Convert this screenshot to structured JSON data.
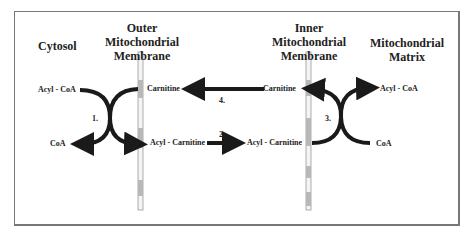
{
  "regions": {
    "cytosol": "Cytosol",
    "outer_membrane": [
      "Outer",
      "Mitochondrial",
      "Membrane"
    ],
    "inner_membrane": [
      "Inner",
      "Mitochondrial",
      "Membrane"
    ],
    "matrix": [
      "Mitochondrial",
      "Matrix"
    ]
  },
  "molecules": {
    "acyl_coa_left": "Acyl - CoA",
    "coa_left": "CoA",
    "carnitine_outer": "Carnitine",
    "acyl_carnitine_outer": "Acyl - Carnitine",
    "carnitine_inner": "Carnitine",
    "acyl_carnitine_inner": "Acyl - Carnitine",
    "acyl_coa_right": "Acyl - CoA",
    "coa_right": "CoA"
  },
  "steps": {
    "step1": "1.",
    "step2": "2.",
    "step3": "3.",
    "step4": "4."
  },
  "colors": {
    "arrow": "#1a1a1a",
    "membrane": "#b8b8b8",
    "frame": "#777777"
  }
}
